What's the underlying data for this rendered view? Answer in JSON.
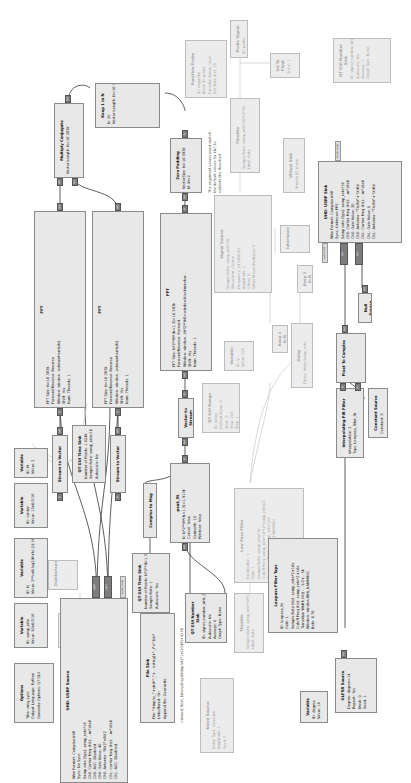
{
  "app": {
    "name": "GNU Radio Companion",
    "orientation": "rotated-90-ccw"
  },
  "blocks": {
    "options": {
      "title": "Options",
      "params": [
        "Title: zmq_sync",
        "Output Language: Python",
        "Generate Options: QT GUI"
      ]
    },
    "var_samp_rate": {
      "title": "Variable",
      "params": [
        "ID: samp_rate",
        "Value: 50e6/2/16"
      ]
    },
    "var_n": {
      "title": "Variable",
      "params": [
        "ID: N",
        "Value: 2**ceil(log2(M+N-1)):16.383k"
      ]
    },
    "var_center": {
      "title": "Variable",
      "params": [
        "ID: center",
        "Value: 15e6/2/16"
      ]
    },
    "var_m": {
      "title": "Variable",
      "params": [
        "ID: M",
        "Value: 2"
      ]
    },
    "virtual_source": {
      "title": "Virtual Source",
      "params": [
        "Stream ID: pulse"
      ]
    },
    "deinterleave": {
      "title": "Deinterleave",
      "params": []
    },
    "usrp_source": {
      "title": "UHD: USRP Source",
      "params": [
        "Wire Format: Complex int8",
        "Sync: No Sync",
        "Samp rate (Sps): samp_rate*16",
        "Ch0: Center Freq (Hz): ...m*16e6",
        "Ch0: AGC: Disabled",
        "Ch0: Gain Value: 40",
        "Ch0: Antenna: \"RX2\"+RX2",
        "Ch1: Center Freq (Hz): ...m*16e6",
        "Ch1: AGC: Disabled",
        "Ch1: Gain Value: 40",
        "Ch1: Antenna: \"RX2\"+RX2",
        "Ch1: AGC: Disabled"
      ],
      "ports": [
        "command",
        "out0",
        "out1",
        "async_msgs"
      ]
    },
    "stream_to_vector_1": {
      "title": "Stream to Vector",
      "params": []
    },
    "stream_to_vector_2": {
      "title": "Stream to Vector",
      "params": []
    },
    "qt_time_sink_top": {
      "title": "QT GUI Time Sink",
      "params": [
        "Number of Points: 1.024k",
        "Sample Rate: samp_rate/16",
        "Autoscale: No"
      ]
    },
    "fft_1": {
      "title": "FFT",
      "params": [
        "FFT Size: N=16.383k",
        "Forward/Reverse: Reverse",
        "Window: window...ackmanharris(N)...",
        "Shift: Yes",
        "Num. Threads: 1"
      ]
    },
    "fft_2": {
      "title": "FFT",
      "params": [
        "FFT Size: N=16.383k",
        "Forward/Reverse: Reverse",
        "Window: window...ackmanharris(N)...",
        "Shift: Yes",
        "Num. Threads: 1"
      ]
    },
    "multiply_conjugate": {
      "title": "Multiply Conjugate",
      "params": [
        "Vector Length: N=16.383k"
      ]
    },
    "keep_1_in_n_top": {
      "title": "Keep 1 in N",
      "params": [
        "N: 20",
        "Vector Length: N=16.383k"
      ]
    },
    "zero_padding": {
      "title": "Zero Padding",
      "params": [
        "VectorSize: N=16.383k",
        "M: M=2"
      ]
    },
    "fft_3": {
      "title": "FFT",
      "params": [
        "FFT Size: N*2**M*(N=1.3)=16.383k",
        "Forward/Reverse: Forward",
        "Window: window...(N*2**(M)=window.blackmanhar...",
        "Shift: Yes",
        "Num. Threads: 1"
      ]
    },
    "vector_to_stream": {
      "title": "Vector to Stream",
      "params": []
    },
    "complex_to_mag": {
      "title": "Complex to Mag",
      "params": []
    },
    "peak_fit": {
      "title": "peak_fit",
      "params": [
        "N: N*2**M*(N=1.3)=1.913k",
        "Cancel: false",
        "Gsmooth: 10",
        "Printeer: false"
      ]
    },
    "qt_time_sink_bottom": {
      "title": "QT GUI Time Sink",
      "params": [
        "Number of Points: N*2**(N-1.3)=1.913k",
        "Sample Rate: 1",
        "Autoscale: Yes"
      ]
    },
    "qt_number_sink_bottom": {
      "title": "QT GUI Number Sink",
      "params": [
        "ID: signal_number_sink_0",
        "Autoscale: No",
        "Average: 0",
        "Graph Type: None"
      ]
    },
    "file_sink": {
      "title": "File Sink",
      "params": [
        "File: \"/tmp/sc_\"+str(i*\"_\"+...+str(g)+\"_i\"+\".bin\"",
        "Unbuffered: On",
        "Append file: Overwrite"
      ],
      "comment": "=mixed_float_binary/inspd/Nmplot2*1n(2048)+4258"
    },
    "noise_source": {
      "title": "Noise Source",
      "params": [
        "Noise Type: Gaussian",
        "Amplitude: 1",
        "Seed: 0"
      ],
      "disabled": true
    },
    "throttle_1": {
      "title": "Throttle",
      "params": [
        "Sample Rate: samp_rate*16*(2**M/2...",
        "Limit: Auto"
      ],
      "disabled": true
    },
    "low_pass_filter": {
      "title": "Low Pass Filter",
      "params": [
        "Decimation: 1",
        "Gain: 1",
        "Sample Rate: samp_rate*16",
        "Cutoff Freq: samp_rate*16*(2*samp_rate)/2",
        "Transition Width: ...samp_rate/100",
        "Window: window...WIN_HAMMING"
      ],
      "disabled": true
    },
    "qt_range": {
      "title": "QT GUI Range",
      "params": [
        "ID: delay",
        "Default Value: 0",
        "Start: 0",
        "Stop: 2e3",
        "Step: 1"
      ],
      "disabled": true
    },
    "var_disabled": {
      "title": "Variable",
      "params": [
        "ID: g",
        "Value: 200"
      ],
      "disabled": true
    },
    "signal_source": {
      "title": "Signal Source",
      "params": [
        "Sample Rate: samp_rate*16",
        "Waveform: Cosine",
        "Frequency: 24.96e6 Hz",
        "Amplitude: 1",
        "Offset: 0",
        "Initial Phase (Radians): 0"
      ],
      "disabled": true
    },
    "keep_1_in_n_a": {
      "title": "Keep 1 in N",
      "params": [
        "N: 2"
      ],
      "disabled": true
    },
    "keep_1_in_n_b": {
      "title": "Keep 1 in N",
      "params": [
        "N: 2"
      ],
      "disabled": true
    },
    "delay": {
      "title": "Delay",
      "params": [
        "Delay: delay/samp_rate"
      ],
      "disabled": true
    },
    "interleave": {
      "title": "Interleave",
      "params": [],
      "disabled": true
    },
    "virtual_sink": {
      "title": "Virtual Sink",
      "params": [
        "Stream ID: pulse"
      ],
      "disabled": true
    },
    "throttle_2": {
      "title": "Throttle",
      "params": [
        "Sample Rate: samp_rate*16*(2**M...",
        "Limit: Auto"
      ],
      "disabled": true
    },
    "probe_signal": {
      "title": "Probe Signal",
      "params": [
        "ID: probe"
      ],
      "disabled": true
    },
    "function_probe": {
      "title": "Function Probe",
      "params": [
        "ID: myprobe",
        "Block ID: probe",
        "Function Name: level",
        "Poll Rate (Hz): 10"
      ],
      "disabled": true
    },
    "int_to_float": {
      "title": "Int To Float",
      "params": [
        "Scale: 1"
      ],
      "disabled": true
    },
    "qt_number_sink_top": {
      "title": "QT GUI Number Sink",
      "params": [
        "ID: signal_number_sink_1",
        "Autoscale: No",
        "Average: 1",
        "Graph Type: None"
      ],
      "disabled": true
    },
    "usrp_sink": {
      "title": "UHD: USRP Sink",
      "params": [
        "Wire Format: Complex int8",
        "Sync: Unknown PPS",
        "Samp rate (Sps): samp_rate*16",
        "Ch0: Center Freq (Hz): ...m*16e6",
        "Ch0: Gain Value: 30",
        "Ch0: Antenna: \"TX/RX\"+TX/RX",
        "Ch1: Center Freq (Hz): ...m*16e6",
        "Ch1: Gain Value: 0",
        "Ch1: Antenna: \"TX/RX\"+TX/RX"
      ],
      "ports": [
        "command",
        "in0",
        "in1",
        "async_msgs"
      ]
    },
    "null_source": {
      "title": "Null Source",
      "params": []
    },
    "float_to_complex": {
      "title": "Float To Complex",
      "params": []
    },
    "interp_fir": {
      "title": "Interpolating FIR Filter",
      "params": [
        "Interpolation: 2",
        "Taps: Lowpass_filter_fir"
      ]
    },
    "constant_source": {
      "title": "Constant Source",
      "params": [
        "Constant: 0"
      ]
    },
    "lowpass_taps": {
      "title": "Lowpass Filter Taps",
      "params": [
        "ID: lowpass_fir",
        "Gain: 1",
        "Sample Rate (Hz): samp_rate*2+16e",
        "Cutoff Freq (Hz): samp_rate*2+16e",
        "Transition Width (Hz): ...5/2+...5k",
        "Window: window.WIN_HAMMING",
        "Beta: 6.76"
      ]
    },
    "var_degree": {
      "title": "Variable",
      "params": [
        "ID: degree",
        "Value: 14"
      ]
    },
    "glfsr_source": {
      "title": "GLFSR Source",
      "params": [
        "Degree: degree=14",
        "Repeat: Yes",
        "Mask: 0",
        "Seed: 1"
      ]
    }
  },
  "comments": {
    "zero_padding_note": [
      "The argument values must match",
      "the default values for LNC to",
      "validate the flowchart"
    ]
  },
  "ports": {
    "out": "out",
    "in": "in",
    "in0": "in0",
    "in1": "in1",
    "out0": "out0",
    "out1": "out1",
    "command": "command",
    "async_msgs": "async_msgs",
    "re": "re",
    "im": "im"
  }
}
